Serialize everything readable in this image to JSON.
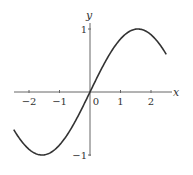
{
  "chart_data": {
    "type": "line",
    "title": "",
    "xlabel": "x",
    "ylabel": "y",
    "function": "y = sin(x)",
    "xlim": [
      -2.5,
      2.5
    ],
    "ylim": [
      -1,
      1
    ],
    "grid": false,
    "legend": null,
    "x_ticks": [
      -2,
      -1,
      0,
      1,
      2
    ],
    "x_tick_labels": [
      "−2",
      "−1",
      "0",
      "1",
      "2"
    ],
    "y_ticks": [
      1,
      -1
    ],
    "y_tick_labels": [
      "1",
      "−1"
    ],
    "series": [
      {
        "name": "sin(x)",
        "x": [
          -2.5,
          -2.0,
          -1.5708,
          -1.0,
          -0.5,
          0,
          0.5,
          1.0,
          1.5708,
          2.0,
          2.5
        ],
        "y": [
          -0.598,
          -0.909,
          -1.0,
          -0.841,
          -0.479,
          0,
          0.479,
          0.841,
          1.0,
          0.909,
          0.598
        ]
      }
    ],
    "colors": {
      "curve": "#333333",
      "axes": "#555555"
    }
  }
}
